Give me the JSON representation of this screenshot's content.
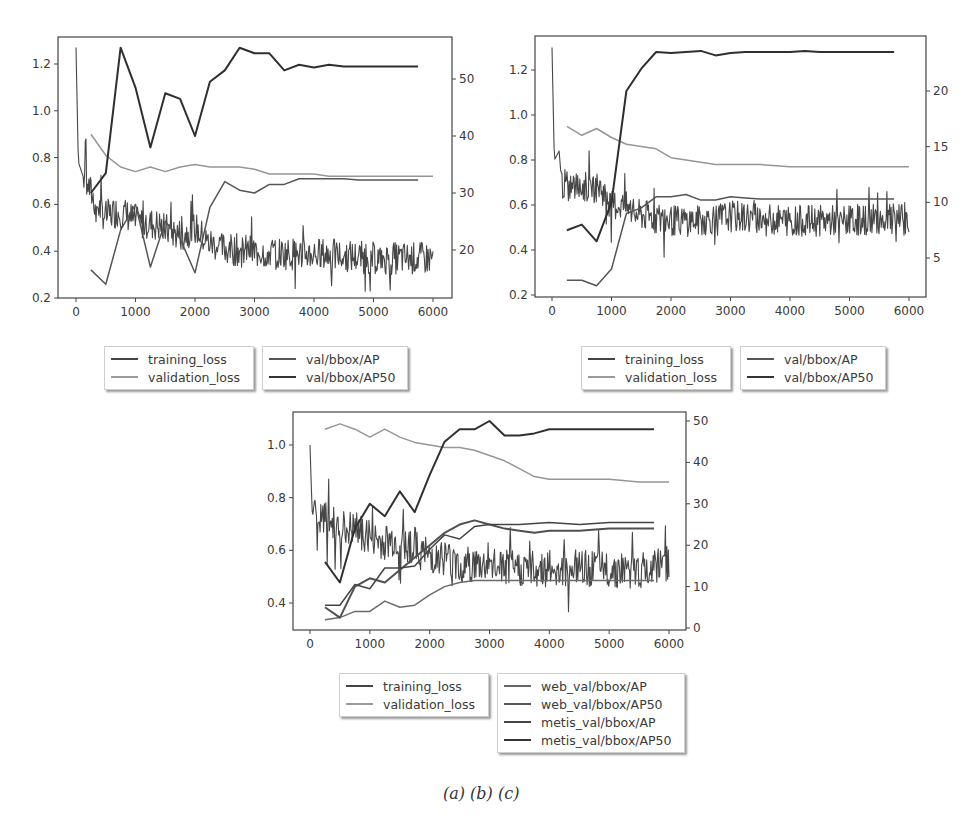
{
  "caption": "(a) (b) (c)",
  "colors": {
    "training_loss": "#444444",
    "validation_loss": "#8f8f8f",
    "ap": "#555555",
    "ap50": "#333333",
    "axis": "#555555"
  },
  "chart_data": [
    {
      "id": "a",
      "type": "line",
      "title": "",
      "xlabel": "",
      "ylabel": "",
      "ylabel_right": "",
      "xlim": [
        -300,
        6300
      ],
      "ylim": [
        0.2,
        1.3
      ],
      "ylim_right": [
        12,
        57
      ],
      "x_ticks": [
        0,
        1000,
        2000,
        3000,
        4000,
        5000,
        6000
      ],
      "y_ticks": [
        "0.2",
        "0.4",
        "0.6",
        "0.8",
        "1.0",
        "1.2"
      ],
      "y_ticks_right": [
        "20",
        "30",
        "40",
        "50"
      ],
      "grid": false,
      "legend": [
        [
          "training_loss",
          "validation_loss"
        ],
        [
          "val/bbox/AP",
          "val/bbox/AP50"
        ]
      ],
      "series": [
        {
          "name": "training_loss",
          "axis": "left",
          "noisy": true,
          "x": [
            0,
            40,
            80,
            120,
            160,
            200,
            300,
            400,
            500,
            600,
            700,
            800,
            900,
            1000,
            1200,
            1400,
            1600,
            1800,
            2000,
            2200,
            2500,
            3000,
            3500,
            4000,
            4500,
            5000,
            5500,
            6000
          ],
          "values": [
            1.27,
            0.78,
            0.75,
            0.72,
            0.9,
            0.68,
            0.62,
            0.58,
            0.55,
            0.56,
            0.57,
            0.56,
            0.55,
            0.52,
            0.52,
            0.51,
            0.48,
            0.47,
            0.5,
            0.44,
            0.41,
            0.4,
            0.39,
            0.39,
            0.38,
            0.37,
            0.37,
            0.37
          ]
        },
        {
          "name": "validation_loss",
          "axis": "left",
          "x": [
            250,
            500,
            750,
            1000,
            1250,
            1500,
            1750,
            2000,
            2250,
            2500,
            2750,
            3000,
            3250,
            3500,
            3750,
            4000,
            4250,
            4500,
            4750,
            5000,
            5250,
            5500,
            5750,
            6000
          ],
          "values": [
            0.9,
            0.81,
            0.76,
            0.74,
            0.76,
            0.74,
            0.76,
            0.77,
            0.76,
            0.76,
            0.76,
            0.75,
            0.73,
            0.73,
            0.73,
            0.73,
            0.72,
            0.72,
            0.72,
            0.72,
            0.72,
            0.72,
            0.72,
            0.72
          ]
        },
        {
          "name": "val/bbox/AP",
          "axis": "right",
          "x": [
            250,
            500,
            750,
            1000,
            1250,
            1500,
            1750,
            2000,
            2250,
            2500,
            2750,
            3000,
            3250,
            3500,
            3750,
            4000,
            4250,
            4500,
            4750,
            5000,
            5250,
            5500,
            5750
          ],
          "values": [
            16.5,
            14,
            23.5,
            28,
            17,
            25,
            22,
            16,
            27.5,
            32,
            30.5,
            30,
            31.5,
            31.5,
            32.5,
            32.5,
            32.5,
            32.5,
            32.3,
            32.3,
            32.3,
            32.3,
            32.3
          ]
        },
        {
          "name": "val/bbox/AP50",
          "axis": "right",
          "x": [
            250,
            500,
            750,
            1000,
            1250,
            1500,
            1750,
            2000,
            2250,
            2500,
            2750,
            3000,
            3250,
            3500,
            3750,
            4000,
            4250,
            4500,
            4750,
            5000,
            5250,
            5500,
            5750
          ],
          "values": [
            30,
            33.5,
            55.5,
            48.5,
            38,
            47.5,
            46.5,
            40,
            49.5,
            51.5,
            55.5,
            54.5,
            54.5,
            51.5,
            52.5,
            52,
            52.5,
            52.2,
            52.2,
            52.2,
            52.2,
            52.2,
            52.2
          ]
        }
      ]
    },
    {
      "id": "b",
      "type": "line",
      "title": "",
      "xlabel": "",
      "ylabel": "",
      "ylabel_right": "",
      "xlim": [
        -300,
        6300
      ],
      "ylim": [
        0.2,
        1.35
      ],
      "ylim_right": [
        1.5,
        25.5
      ],
      "x_ticks": [
        0,
        1000,
        2000,
        3000,
        4000,
        5000,
        6000
      ],
      "y_ticks": [
        "0.2",
        "0.4",
        "0.6",
        "0.8",
        "1.0",
        "1.2"
      ],
      "y_ticks_right": [
        "5",
        "10",
        "15",
        "20"
      ],
      "grid": false,
      "legend": [
        [
          "training_loss",
          "validation_loss"
        ],
        [
          "val/bbox/AP",
          "val/bbox/AP50"
        ]
      ],
      "series": [
        {
          "name": "training_loss",
          "axis": "left",
          "noisy": true,
          "x": [
            0,
            40,
            80,
            120,
            160,
            200,
            400,
            600,
            800,
            1000,
            1200,
            1400,
            1600,
            2000,
            2500,
            3000,
            3500,
            4000,
            4500,
            5000,
            5500,
            6000
          ],
          "values": [
            1.3,
            0.8,
            0.82,
            0.84,
            0.7,
            0.69,
            0.68,
            0.68,
            0.68,
            0.6,
            0.6,
            0.56,
            0.55,
            0.53,
            0.53,
            0.55,
            0.54,
            0.53,
            0.53,
            0.53,
            0.54,
            0.53
          ]
        },
        {
          "name": "validation_loss",
          "axis": "left",
          "x": [
            250,
            500,
            750,
            1000,
            1250,
            1500,
            1750,
            2000,
            2250,
            2500,
            2750,
            3000,
            3500,
            4000,
            4500,
            5000,
            5500,
            6000
          ],
          "values": [
            0.95,
            0.91,
            0.94,
            0.9,
            0.87,
            0.86,
            0.85,
            0.81,
            0.8,
            0.79,
            0.78,
            0.78,
            0.78,
            0.77,
            0.77,
            0.77,
            0.77,
            0.77
          ]
        },
        {
          "name": "val/bbox/AP",
          "axis": "right",
          "x": [
            250,
            500,
            750,
            1000,
            1250,
            1500,
            1750,
            2000,
            2250,
            2500,
            2750,
            3000,
            3250,
            3500,
            4000,
            4500,
            5000,
            5500,
            5750
          ],
          "values": [
            3,
            3,
            2.5,
            4,
            9,
            9.5,
            10.5,
            10.5,
            10.7,
            10.2,
            10.2,
            10.5,
            10.4,
            10.3,
            10.3,
            10.3,
            10.3,
            10.3,
            10.3
          ]
        },
        {
          "name": "val/bbox/AP50",
          "axis": "right",
          "x": [
            250,
            500,
            750,
            1000,
            1250,
            1500,
            1750,
            2000,
            2250,
            2500,
            2750,
            3000,
            3250,
            3500,
            4000,
            4250,
            4500,
            5000,
            5500,
            5750
          ],
          "values": [
            7.5,
            8,
            6.5,
            10,
            20,
            22,
            23.5,
            23.4,
            23.5,
            23.6,
            23.2,
            23.4,
            23.5,
            23.5,
            23.5,
            23.6,
            23.5,
            23.5,
            23.5,
            23.5
          ]
        }
      ]
    },
    {
      "id": "c",
      "type": "line",
      "title": "",
      "xlabel": "",
      "ylabel": "",
      "ylabel_right": "",
      "xlim": [
        -300,
        6300
      ],
      "ylim": [
        0.3,
        1.1
      ],
      "ylim_right": [
        0,
        50
      ],
      "x_ticks": [
        0,
        1000,
        2000,
        3000,
        4000,
        5000,
        6000
      ],
      "y_ticks": [
        "0.4",
        "0.6",
        "0.8",
        "1.0"
      ],
      "y_ticks_right": [
        "0",
        "10",
        "20",
        "30",
        "40",
        "50"
      ],
      "grid": false,
      "legend": [
        [
          "training_loss",
          "validation_loss"
        ],
        [
          "web_val/bbox/AP",
          "web_val/bbox/AP50",
          "metis_val/bbox/AP",
          "metis_val/bbox/AP50"
        ]
      ],
      "series": [
        {
          "name": "training_loss",
          "axis": "left",
          "noisy": true,
          "x": [
            0,
            40,
            80,
            120,
            200,
            400,
            600,
            800,
            1000,
            1200,
            1400,
            1600,
            1800,
            2000,
            2200,
            2500,
            3000,
            3500,
            4000,
            4500,
            5000,
            5500,
            6000
          ],
          "values": [
            1.0,
            0.72,
            0.8,
            0.7,
            0.72,
            0.7,
            0.68,
            0.68,
            0.65,
            0.63,
            0.64,
            0.63,
            0.6,
            0.58,
            0.58,
            0.55,
            0.54,
            0.53,
            0.53,
            0.53,
            0.53,
            0.52,
            0.55
          ]
        },
        {
          "name": "validation_loss",
          "axis": "left",
          "x": [
            250,
            500,
            750,
            1000,
            1250,
            1500,
            1750,
            2000,
            2250,
            2500,
            2750,
            3000,
            3250,
            3500,
            3750,
            4000,
            4500,
            5000,
            5500,
            6000
          ],
          "values": [
            1.06,
            1.08,
            1.06,
            1.03,
            1.06,
            1.03,
            1.01,
            1.0,
            0.99,
            0.99,
            0.98,
            0.96,
            0.94,
            0.91,
            0.88,
            0.87,
            0.87,
            0.87,
            0.86,
            0.86
          ]
        },
        {
          "name": "web_val/bbox/AP",
          "axis": "right",
          "x": [
            250,
            500,
            750,
            1000,
            1250,
            1500,
            1750,
            2000,
            2250,
            2500,
            2750,
            3000,
            3500,
            4000,
            4500,
            5000,
            5500,
            5750
          ],
          "values": [
            2,
            2.5,
            4,
            4,
            6.5,
            5,
            5.5,
            8,
            10,
            11,
            11.5,
            11.5,
            11.5,
            11.5,
            11.5,
            11.5,
            11.5,
            11.5
          ]
        },
        {
          "name": "web_val/bbox/AP50",
          "axis": "right",
          "x": [
            250,
            500,
            750,
            1000,
            1250,
            1500,
            1750,
            2000,
            2250,
            2500,
            2750,
            3000,
            3250,
            3500,
            3750,
            4000,
            4500,
            5000,
            5500,
            5750
          ],
          "values": [
            5,
            2.5,
            10,
            12,
            11,
            14,
            17,
            20,
            23,
            25,
            26,
            25,
            24,
            23.5,
            23,
            23.5,
            23.5,
            24,
            24,
            24
          ]
        },
        {
          "name": "metis_val/bbox/AP",
          "axis": "right",
          "x": [
            250,
            500,
            750,
            1000,
            1250,
            1500,
            1750,
            2000,
            2250,
            2500,
            2750,
            3000,
            3250,
            3500,
            4000,
            4500,
            5000,
            5500,
            5750
          ],
          "values": [
            5.5,
            5.5,
            10.5,
            9.5,
            14.5,
            14.5,
            15,
            19,
            22.5,
            21.5,
            24.5,
            25,
            25,
            25,
            25.5,
            25,
            25.5,
            25.5,
            25.5
          ]
        },
        {
          "name": "metis_val/bbox/AP50",
          "axis": "right",
          "x": [
            250,
            500,
            750,
            1000,
            1250,
            1500,
            1750,
            2000,
            2250,
            2500,
            2750,
            3000,
            3250,
            3500,
            3750,
            4000,
            4500,
            5000,
            5500,
            5750
          ],
          "values": [
            16,
            11,
            24,
            30,
            27,
            33,
            28,
            37,
            45,
            48,
            48,
            50,
            46.5,
            46.5,
            47,
            48,
            48,
            48,
            48,
            48
          ]
        }
      ]
    }
  ],
  "legends": {
    "a": {
      "left": [
        "training_loss",
        "validation_loss"
      ],
      "right": [
        "val/bbox/AP",
        "val/bbox/AP50"
      ]
    },
    "b": {
      "left": [
        "training_loss",
        "validation_loss"
      ],
      "right": [
        "val/bbox/AP",
        "val/bbox/AP50"
      ]
    },
    "c": {
      "left": [
        "training_loss",
        "validation_loss"
      ],
      "right": [
        "web_val/bbox/AP",
        "web_val/bbox/AP50",
        "metis_val/bbox/AP",
        "metis_val/bbox/AP50"
      ]
    }
  }
}
